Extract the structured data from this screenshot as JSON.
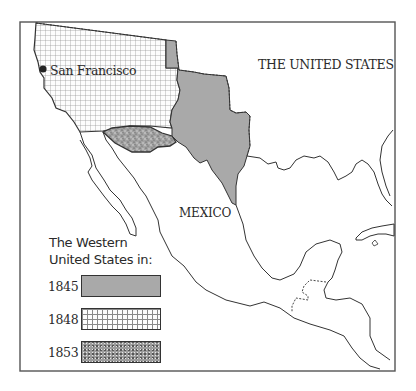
{
  "map": {
    "title_labels": {
      "united_states": "THE UNITED STATES",
      "mexico": "MEXICO",
      "city": "San Francisco"
    },
    "colors": {
      "frame": "#555555",
      "coastline": "#333333",
      "region_1845_fill": "#a9a9a9",
      "region_1848_grid": "#8a8a8a",
      "region_1853_fill": "#9c9c9c",
      "background": "#ffffff"
    },
    "icons": {
      "city_marker": "filled-circle"
    }
  },
  "legend": {
    "title_line1": "The Western",
    "title_line2": "United States in:",
    "items": [
      {
        "year": "1845",
        "pattern": "solid-gray"
      },
      {
        "year": "1848",
        "pattern": "grid"
      },
      {
        "year": "1853",
        "pattern": "stipple"
      }
    ]
  }
}
